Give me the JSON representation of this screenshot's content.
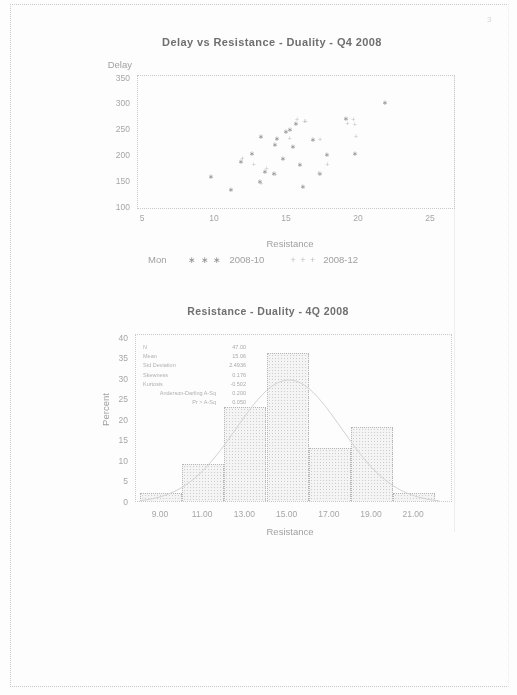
{
  "page": {
    "number": "3"
  },
  "colors": {
    "ink": "#6f6f6f",
    "muted": "#a0a0a0",
    "faint": "#c9c9c9",
    "bar_fill": "#f4f4f4",
    "bar_dot": "#cdcdcd",
    "bar_border": "#b5b5b5",
    "curve": "#d2d2d2",
    "marker_primary": "#8f8f8f",
    "marker_secondary": "#c2c2c2"
  },
  "scatter_chart": {
    "title": "Delay vs Resistance - Duality - Q4 2008",
    "y_axis_title": "Delay",
    "x_axis_title": "Resistance",
    "legend_title": "Mon",
    "legend": [
      {
        "marker_glyph": "∗ ∗ ∗",
        "label": "2008-10"
      },
      {
        "marker_glyph": "+ + +",
        "label": "2008-12"
      }
    ]
  },
  "histogram_chart": {
    "title": "Resistance - Duality - 4Q 2008",
    "y_axis_title": "Percent",
    "x_axis_title": "Resistance",
    "inset_stats": [
      {
        "label": "N",
        "value": "47.00"
      },
      {
        "label": "Mean",
        "value": "15.06"
      },
      {
        "label": "Std Deviation",
        "value": "2.4936"
      },
      {
        "label": "Skewness",
        "value": "0.176"
      },
      {
        "label": "Kurtosis",
        "value": "-0.502"
      },
      {
        "label": "Anderson-Darling A-Sq",
        "value": "0.200"
      },
      {
        "label": "Pr > A-Sq",
        "value": "0.050"
      }
    ]
  },
  "chart_data": [
    {
      "type": "scatter",
      "title": "Delay vs Resistance - Duality - Q4 2008",
      "xlabel": "Resistance",
      "ylabel": "Delay",
      "xlim": [
        5,
        25
      ],
      "ylim": [
        100,
        350
      ],
      "x_ticks": [
        5,
        10,
        15,
        20,
        25
      ],
      "y_ticks": [
        350,
        300,
        250,
        200,
        150,
        100
      ],
      "legend_title": "Mon",
      "legend_position": "bottom",
      "grid": false,
      "series": [
        {
          "name": "2008-10",
          "marker": "asterisk",
          "marker_char": "∗",
          "points": [
            [
              9.7,
              162
            ],
            [
              11.1,
              137
            ],
            [
              11.8,
              191
            ],
            [
              12.6,
              207
            ],
            [
              13.1,
              152
            ],
            [
              13.2,
              240
            ],
            [
              13.5,
              172
            ],
            [
              14.1,
              168
            ],
            [
              14.2,
              224
            ],
            [
              14.3,
              236
            ],
            [
              14.7,
              197
            ],
            [
              14.9,
              249
            ],
            [
              15.2,
              253
            ],
            [
              15.4,
              220
            ],
            [
              15.6,
              265
            ],
            [
              15.9,
              185
            ],
            [
              16.1,
              143
            ],
            [
              16.8,
              234
            ],
            [
              17.3,
              168
            ],
            [
              17.8,
              205
            ],
            [
              19.1,
              274
            ],
            [
              19.7,
              207
            ],
            [
              21.8,
              306
            ]
          ]
        },
        {
          "name": "2008-12",
          "marker": "plus",
          "marker_char": "+",
          "points": [
            [
              11.9,
              197
            ],
            [
              12.7,
              185
            ],
            [
              13.2,
              148
            ],
            [
              13.6,
              178
            ],
            [
              14.2,
              166
            ],
            [
              15.2,
              236
            ],
            [
              15.7,
              272
            ],
            [
              16.2,
              269
            ],
            [
              16.3,
              268
            ],
            [
              17.2,
              168
            ],
            [
              17.3,
              234
            ],
            [
              17.8,
              185
            ],
            [
              19.2,
              265
            ],
            [
              19.6,
              272
            ],
            [
              19.7,
              263
            ],
            [
              19.8,
              240
            ]
          ]
        }
      ]
    },
    {
      "type": "bar",
      "subtype": "histogram",
      "title": "Resistance - Duality - 4Q 2008",
      "xlabel": "Resistance",
      "ylabel": "Percent",
      "bin_midpoints": [
        9,
        11,
        13,
        15,
        17,
        19,
        21
      ],
      "bin_width": 2,
      "values": [
        2,
        9,
        23,
        36,
        13,
        18,
        2
      ],
      "x_tick_labels": [
        "9.00",
        "11.00",
        "13.00",
        "15.00",
        "17.00",
        "19.00",
        "21.00"
      ],
      "y_ticks": [
        0,
        5,
        10,
        15,
        20,
        25,
        30,
        35,
        40
      ],
      "ylim": [
        0,
        40
      ],
      "grid": false,
      "normal_curve": {
        "mean": 15.06,
        "std": 2.4936,
        "peak_percent": 30
      },
      "inset_stats": {
        "N": "47.00",
        "Mean": "15.06",
        "Std Deviation": "2.4936",
        "Skewness": "0.176",
        "Kurtosis": "-0.502",
        "Anderson-Darling A-Sq": "0.200",
        "Pr > A-Sq": "0.050"
      }
    }
  ]
}
